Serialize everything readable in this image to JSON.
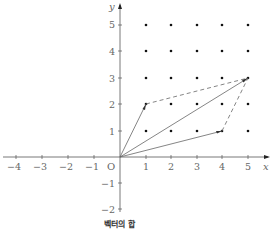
{
  "figure": {
    "caption": "벡터의 합",
    "axis_labels": {
      "x": "x",
      "y": "y",
      "origin": "O"
    },
    "x_ticks": [
      "−4",
      "−3",
      "−2",
      "−1",
      "1",
      "2",
      "3",
      "4",
      "5"
    ],
    "y_ticks": [
      "5",
      "4",
      "3",
      "2",
      "1",
      "−1",
      "−2"
    ],
    "grid_points": "integer lattice x=1..5, y=1..5",
    "vectors": [
      {
        "name": "a",
        "from": [
          0,
          0
        ],
        "to": [
          1,
          2
        ],
        "style": "solid"
      },
      {
        "name": "b",
        "from": [
          0,
          0
        ],
        "to": [
          4,
          1
        ],
        "style": "solid"
      },
      {
        "name": "a+b",
        "from": [
          0,
          0
        ],
        "to": [
          5,
          3
        ],
        "style": "solid"
      }
    ],
    "parallelogram_edges": [
      {
        "from": [
          1,
          2
        ],
        "to": [
          5,
          3
        ],
        "style": "dashed"
      },
      {
        "from": [
          4,
          1
        ],
        "to": [
          5,
          3
        ],
        "style": "dashed"
      }
    ],
    "colors": {
      "axis": "#555555",
      "line": "#666666",
      "dot": "#111111",
      "text": "#666666"
    }
  }
}
